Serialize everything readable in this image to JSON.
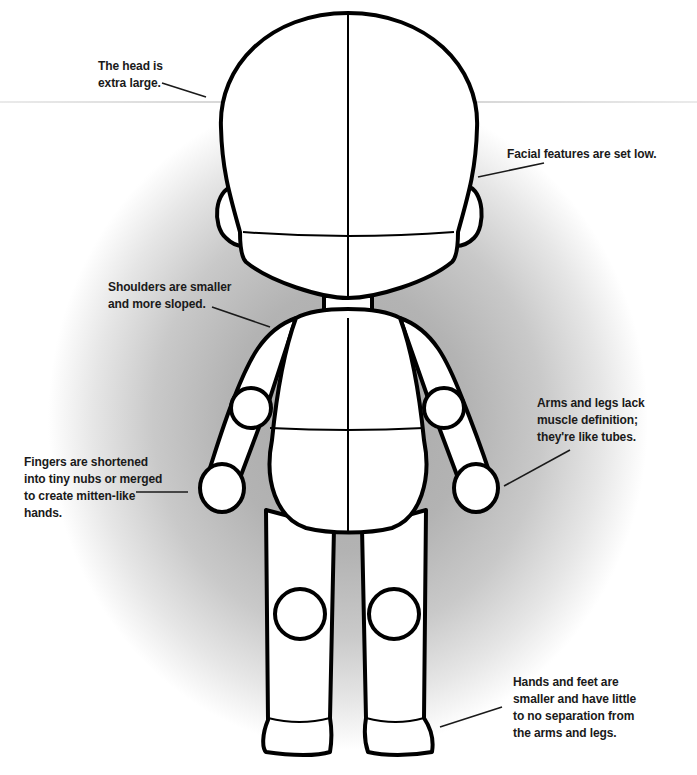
{
  "diagram": {
    "title": "",
    "colors": {
      "outline": "#000000",
      "fill": "#ffffff",
      "background_glow": "#a8a8a8",
      "text": "#1a1a1a"
    }
  },
  "annotations": [
    {
      "id": "head",
      "text": "The head is\nextra large."
    },
    {
      "id": "face",
      "text": "Facial features are set low."
    },
    {
      "id": "shoulders",
      "text": "Shoulders are smaller\nand more sloped."
    },
    {
      "id": "limbs",
      "text": "Arms and legs lack\nmuscle definition;\nthey're like tubes."
    },
    {
      "id": "fingers",
      "text": "Fingers are shortened\ninto tiny nubs or merged\nto create mitten-like\nhands."
    },
    {
      "id": "hands-feet",
      "text": "Hands and feet are\nsmaller and have little\nto no separation from\nthe arms and legs."
    }
  ]
}
